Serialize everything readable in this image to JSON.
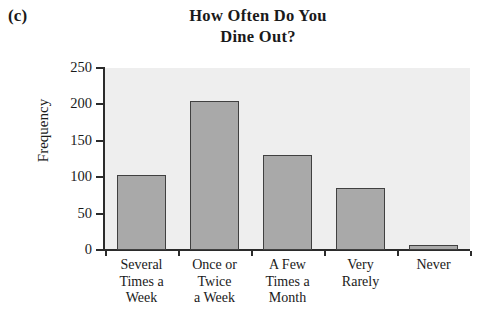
{
  "panel": {
    "label": "(c)"
  },
  "chart_data": {
    "type": "bar",
    "title": "How Often Do You Dine Out?",
    "title_line1": "How Often Do You",
    "title_line2": "Dine Out?",
    "xlabel": "",
    "ylabel": "Frequency",
    "categories": [
      "Several Times a Week",
      "Once or Twice a Week",
      "A Few Times a Month",
      "Very Rarely",
      "Never"
    ],
    "category_lines": [
      [
        "Several",
        "Times a",
        "Week"
      ],
      [
        "Once or",
        "Twice",
        "a Week"
      ],
      [
        "A Few",
        "Times a",
        "Month"
      ],
      [
        "Very",
        "Rarely"
      ],
      [
        "Never"
      ]
    ],
    "values": [
      103,
      205,
      131,
      85,
      7
    ],
    "ylim": [
      0,
      250
    ],
    "yticks": [
      0,
      50,
      100,
      150,
      200,
      250
    ],
    "ytick_labels": [
      "0",
      "50",
      "100",
      "150",
      "200",
      "250"
    ],
    "grid": false,
    "legend": null,
    "bar_fill_color": "#a9a9a9",
    "bar_edge_color": "#404040",
    "plot_background_color": "#eeeeee",
    "axis_color": "#2b2b2b"
  }
}
